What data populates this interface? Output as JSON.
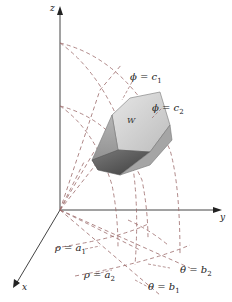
{
  "figure": {
    "type": "spherical-wedge-diagram",
    "axes": {
      "z_label": "z",
      "y_label": "y",
      "x_label": "x"
    },
    "region_label": "W",
    "surfaces": {
      "phi_c1": {
        "lhs": "ϕ = c",
        "sub": "1"
      },
      "phi_c2": {
        "lhs": "ϕ = c",
        "sub": "2"
      },
      "rho_a1": {
        "lhs": "ρ = a",
        "sub": "1"
      },
      "rho_a2": {
        "lhs": "ρ = a",
        "sub": "2"
      },
      "theta_b1": {
        "lhs": "θ = b",
        "sub": "1"
      },
      "theta_b2": {
        "lhs": "θ = b",
        "sub": "2"
      }
    },
    "colors": {
      "axis": "#444444",
      "dashed": "#9a6a6a",
      "wedge_light": "#d8d8d8",
      "wedge_dark": "#6e6e6e",
      "text": "#222222"
    }
  }
}
